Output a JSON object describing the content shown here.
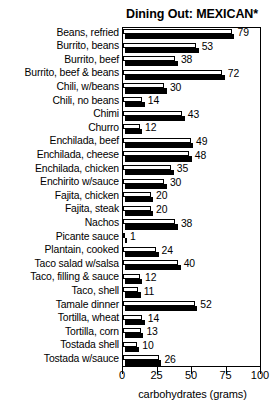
{
  "chart_data": {
    "type": "bar",
    "orientation": "horizontal",
    "title": "Dining Out: MEXICAN*",
    "xlabel": "carbohydrates (grams)",
    "ylabel": "",
    "xlim": [
      0,
      100
    ],
    "xticks": [
      0,
      25,
      50,
      75,
      100
    ],
    "xticklabels": [
      "0",
      "25",
      "50",
      "75",
      "100"
    ],
    "grid": false,
    "legend": null,
    "categories": [
      "Beans, refried",
      "Burrito, beans",
      "Burrito, beef",
      "Burrito, beef & beans",
      "Chili, w/beans",
      "Chili, no beans",
      "Chimi",
      "Churro",
      "Enchilada, beef",
      "Enchilada, cheese",
      "Enchilada, chicken",
      "Enchirito w/sauce",
      "Fajita, chicken",
      "Fajita, steak",
      "Nachos",
      "Picante sauce",
      "Plantain, cooked",
      "Taco salad w/salsa",
      "Taco, filling & sauce",
      "Taco, shell",
      "Tamale dinner",
      "Tortilla, wheat",
      "Tortilla, corn",
      "Tostada shell",
      "Tostada w/sauce"
    ],
    "values": [
      79,
      53,
      38,
      72,
      30,
      14,
      43,
      12,
      49,
      48,
      35,
      30,
      20,
      20,
      38,
      1,
      24,
      40,
      12,
      11,
      52,
      14,
      13,
      10,
      26
    ],
    "value_labels": [
      "79",
      "53",
      "38",
      "72",
      "30",
      "14",
      "43",
      "12",
      "49",
      "48",
      "35",
      "30",
      "20",
      "20",
      "38",
      "1",
      "24",
      "40",
      "12",
      "11",
      "52",
      "14",
      "13",
      "10",
      "26"
    ]
  },
  "colors": {
    "bar_face": "#ffffff",
    "bar_shadow": "#000000",
    "outline": "#000000",
    "background": "#ffffff",
    "text": "#000000"
  }
}
